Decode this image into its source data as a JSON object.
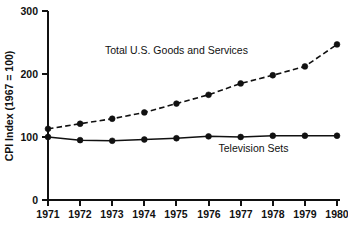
{
  "chart_data": {
    "type": "line",
    "title": "",
    "subtitle": "",
    "xlabel": "",
    "ylabel": "CPI Index (1967  =  100)",
    "x": [
      1971,
      1972,
      1973,
      1974,
      1975,
      1976,
      1977,
      1978,
      1979,
      1980
    ],
    "categories": [
      "1971",
      "1972",
      "1973",
      "1974",
      "1975",
      "1976",
      "1977",
      "1978",
      "1979",
      "1980"
    ],
    "xlim": [
      1971,
      1980
    ],
    "ylim": [
      0,
      300
    ],
    "yticks": [
      0,
      100,
      200,
      300
    ],
    "ytick_labels": [
      "0",
      "100",
      "200",
      "300"
    ],
    "xticks": [
      1971,
      1972,
      1973,
      1974,
      1975,
      1976,
      1977,
      1978,
      1979,
      1980
    ],
    "xtick_labels": [
      "1971",
      "1972",
      "1973",
      "1974",
      "1975",
      "1976",
      "1977",
      "1978",
      "1979",
      "1980"
    ],
    "grid": false,
    "legend": "inline-annotations",
    "legend_position": "inline",
    "series": [
      {
        "name": "Total U.S. Goods and Services",
        "style": "dashed",
        "marker": "filled-circle",
        "color": "#111111",
        "values": [
          113,
          121,
          129,
          139,
          153,
          167,
          185,
          198,
          212,
          247
        ],
        "annotation": {
          "text": "Total U.S. Goods and Services",
          "x": 1975,
          "y": 232
        }
      },
      {
        "name": "Television Sets",
        "style": "solid",
        "marker": "filled-circle",
        "color": "#111111",
        "values": [
          100,
          95,
          94,
          96,
          98,
          101,
          100,
          102,
          102,
          102
        ],
        "annotation": {
          "text": "Television Sets",
          "x": 1977.4,
          "y": 76
        }
      }
    ]
  },
  "axes": {
    "y_axis_title": "CPI Index (1967  =  100)",
    "x_axis_title": ""
  }
}
